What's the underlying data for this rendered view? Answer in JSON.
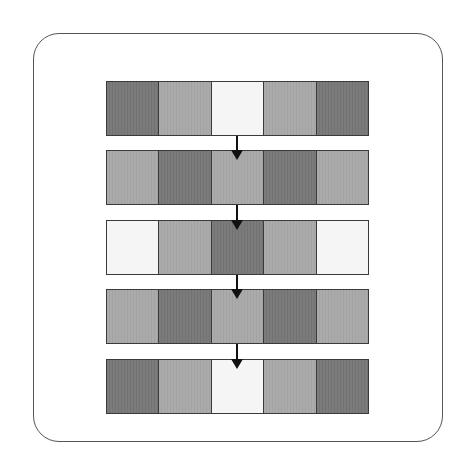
{
  "diagram": {
    "type": "sequence of 5-cell rows connected by downward arrows",
    "colors": {
      "dark": "#777777",
      "mid": "#a8a8a8",
      "light": "#f5f5f5",
      "border": "#3a3a3a"
    },
    "rows": [
      {
        "cells": [
          "dark",
          "mid",
          "light",
          "mid",
          "dark"
        ]
      },
      {
        "cells": [
          "mid",
          "dark",
          "mid",
          "dark",
          "mid"
        ]
      },
      {
        "cells": [
          "light",
          "mid",
          "dark",
          "mid",
          "light"
        ]
      },
      {
        "cells": [
          "mid",
          "dark",
          "mid",
          "dark",
          "mid"
        ]
      },
      {
        "cells": [
          "dark",
          "mid",
          "light",
          "mid",
          "dark"
        ]
      }
    ],
    "arrows": [
      {
        "from": 0,
        "to": 1,
        "icon": "arrow-down-icon"
      },
      {
        "from": 1,
        "to": 2,
        "icon": "arrow-down-icon"
      },
      {
        "from": 2,
        "to": 3,
        "icon": "arrow-down-icon"
      },
      {
        "from": 3,
        "to": 4,
        "icon": "arrow-down-icon"
      }
    ]
  }
}
